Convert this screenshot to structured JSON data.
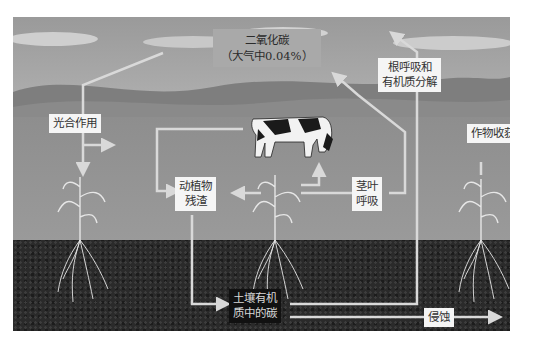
{
  "diagram": {
    "nodes": {
      "co2": {
        "line1": "二氧化碳",
        "line2": "（大气中0.04%）"
      },
      "photosynthesis": {
        "label": "光合作用"
      },
      "residue": {
        "line1": "动植物",
        "line2": "残渣"
      },
      "leaf_respiration": {
        "line1": "茎叶",
        "line2": "呼吸"
      },
      "root_respiration": {
        "line1": "根呼吸和",
        "line2": "有机质分解"
      },
      "harvest": {
        "label": "作物收获"
      },
      "soil_carbon": {
        "line1": "土壤有机",
        "line2": "质中的碳"
      },
      "erosion": {
        "label": "侵蚀"
      }
    },
    "edges": [
      {
        "from": "co2",
        "to": "photosynthesis"
      },
      {
        "from": "photosynthesis",
        "to": "plant"
      },
      {
        "from": "plant",
        "to": "cow"
      },
      {
        "from": "cow",
        "to": "residue"
      },
      {
        "from": "plant",
        "to": "residue"
      },
      {
        "from": "leaf_respiration",
        "to": "co2"
      },
      {
        "from": "residue",
        "to": "soil_carbon"
      },
      {
        "from": "soil_carbon",
        "to": "root_respiration"
      },
      {
        "from": "root_respiration",
        "to": "co2"
      },
      {
        "from": "plant",
        "to": "harvest"
      },
      {
        "from": "soil_carbon",
        "to": "erosion"
      }
    ],
    "colors": {
      "sky": "#a0a0a0",
      "field": "#939393",
      "soil": "#2a2a2a",
      "arrow": "#d9d9d9",
      "label_bg": "#f5f5f5"
    }
  }
}
